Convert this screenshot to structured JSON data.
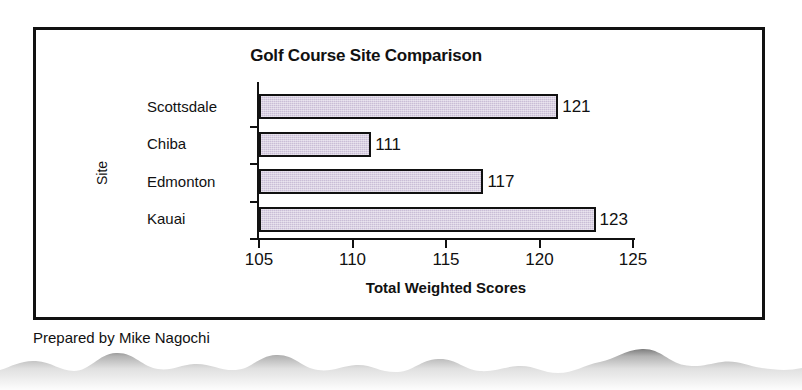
{
  "document": {
    "caption": "Prepared by Mike Nagochi"
  },
  "chart_data": {
    "type": "bar",
    "orientation": "horizontal",
    "title": "Golf Course Site Comparison",
    "xlabel": "Total Weighted Scores",
    "ylabel": "Site",
    "categories": [
      "Scottsdale",
      "Chiba",
      "Edmonton",
      "Kauai"
    ],
    "values": [
      121,
      111,
      117,
      123
    ],
    "data_labels": [
      "121",
      "111",
      "117",
      "123"
    ],
    "xlim": [
      105,
      125
    ],
    "xticks": [
      105,
      110,
      115,
      120,
      125
    ],
    "xtick_labels": [
      "105",
      "110",
      "115",
      "120",
      "125"
    ],
    "grid": false,
    "legend": false,
    "series": [
      {
        "name": "Total Weighted Scores",
        "values": [
          121,
          111,
          117,
          123
        ]
      }
    ],
    "colors": {
      "bar_fill": "#c9bdd6",
      "bar_border": "#111111",
      "axis": "#111111",
      "text": "#111111",
      "background": "#ffffff"
    }
  }
}
